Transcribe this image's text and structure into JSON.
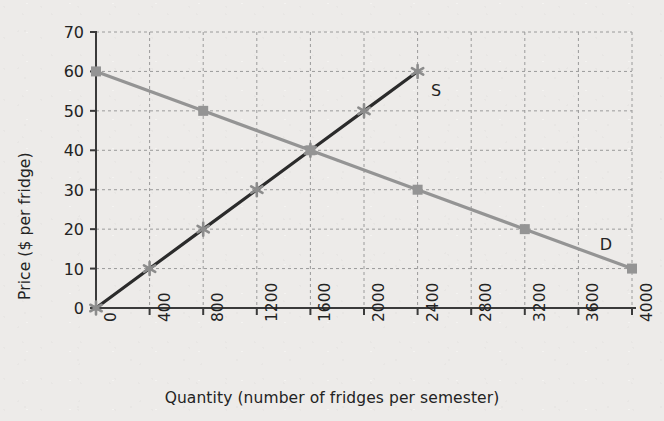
{
  "chart_data": {
    "type": "line",
    "title": "",
    "xlabel": "Quantity (number of fridges per semester)",
    "ylabel": "Price ($ per fridge)",
    "xlim": [
      0,
      4000
    ],
    "ylim": [
      0,
      70
    ],
    "xticks": [
      "0",
      "400",
      "800",
      "1200",
      "1600",
      "2000",
      "2400",
      "2800",
      "3200",
      "3600",
      "4000"
    ],
    "xtick_values": [
      0,
      400,
      800,
      1200,
      1600,
      2000,
      2400,
      2800,
      3200,
      3600,
      4000
    ],
    "yticks": [
      "0",
      "10",
      "20",
      "30",
      "40",
      "50",
      "60",
      "70"
    ],
    "ytick_values": [
      0,
      10,
      20,
      30,
      40,
      50,
      60,
      70
    ],
    "grid": true,
    "grid_style": "dashed",
    "legend_position": "inline-end-labels",
    "series": [
      {
        "name": "S",
        "label": "S",
        "description": "Supply curve",
        "color": "#2b2b2b",
        "marker": "star",
        "marker_color": "#8c8c8c",
        "x": [
          0,
          400,
          800,
          1200,
          1600,
          2000,
          2400
        ],
        "y": [
          0,
          10,
          20,
          30,
          40,
          50,
          60
        ],
        "label_x": 2500,
        "label_y": 55
      },
      {
        "name": "D",
        "label": "D",
        "description": "Demand curve",
        "color": "#949494",
        "marker": "square",
        "marker_color": "#949494",
        "x": [
          0,
          800,
          1600,
          2400,
          3200,
          4000
        ],
        "y": [
          60,
          50,
          40,
          30,
          20,
          10
        ],
        "label_x": 3760,
        "label_y": 16
      }
    ],
    "equilibrium": {
      "quantity": 1600,
      "price": 40
    }
  },
  "colors": {
    "background": "#edebe9",
    "axis": "#3a3a3a",
    "grid": "#9a9a9a",
    "supply": "#2b2b2b",
    "demand": "#949494",
    "text": "#232323"
  }
}
